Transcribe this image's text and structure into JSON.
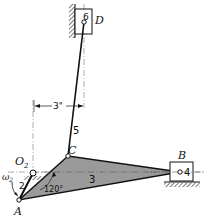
{
  "diagram": {
    "type": "slider-crank linkage mechanism",
    "points": {
      "O2": {
        "label": "O",
        "subscript": "2"
      },
      "A": {
        "label": "A"
      },
      "B": {
        "label": "B"
      },
      "C": {
        "label": "C"
      },
      "D": {
        "label": "D"
      }
    },
    "links": {
      "link2": "2",
      "link3": "3",
      "link4": "4",
      "link5": "5",
      "link6": "6"
    },
    "dimensions": {
      "offset": "3\"",
      "angle": "120°"
    },
    "angular_velocity": {
      "symbol": "ω",
      "subscript": "2"
    },
    "colors": {
      "link3_fill": "#9a9a9a",
      "line": "#111111",
      "centerline": "#666666"
    }
  }
}
